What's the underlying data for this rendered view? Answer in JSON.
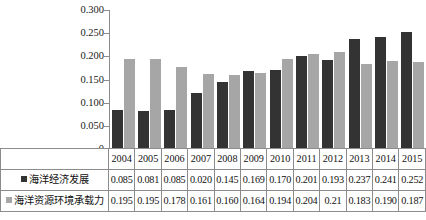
{
  "chart_data": {
    "type": "bar",
    "title": "",
    "xlabel": "",
    "ylabel": "",
    "ylim": [
      0,
      0.3
    ],
    "grid": false,
    "legend_position": "table-row-header",
    "categories": [
      "2004",
      "2005",
      "2006",
      "2007",
      "2008",
      "2009",
      "2010",
      "2011",
      "2012",
      "2013",
      "2014",
      "2015"
    ],
    "y_ticks": [
      "0.300",
      "0.250",
      "0.200",
      "0.150",
      "0.100",
      "0.050",
      "0"
    ],
    "y_tick_values": [
      0.3,
      0.25,
      0.2,
      0.15,
      0.1,
      0.05,
      0
    ],
    "series": [
      {
        "name": "海洋经济发展",
        "color": "#333333",
        "values": [
          0.085,
          0.081,
          0.085,
          0.02,
          0.145,
          0.169,
          0.17,
          0.201,
          0.193,
          0.237,
          0.241,
          0.252
        ],
        "labels": [
          "0.085",
          "0.081",
          "0.085",
          "0.020",
          "0.145",
          "0.169",
          "0.170",
          "0.201",
          "0.193",
          "0.237",
          "0.241",
          "0.252"
        ],
        "plotted_values": [
          0.085,
          0.081,
          0.085,
          0.12,
          0.145,
          0.169,
          0.17,
          0.201,
          0.193,
          0.237,
          0.241,
          0.252
        ]
      },
      {
        "name": "海洋资源环境承载力",
        "color": "#a6a6a6",
        "values": [
          0.195,
          0.195,
          0.178,
          0.161,
          0.16,
          0.164,
          0.194,
          0.204,
          0.21,
          0.183,
          0.19,
          0.187
        ],
        "labels": [
          "0.195",
          "0.195",
          "0.178",
          "0.161",
          "0.160",
          "0.164",
          "0.194",
          "0.204",
          "0.21",
          "0.183",
          "0.190",
          "0.187"
        ],
        "plotted_values": [
          0.195,
          0.195,
          0.178,
          0.161,
          0.16,
          0.164,
          0.194,
          0.204,
          0.21,
          0.183,
          0.19,
          0.187
        ]
      }
    ]
  },
  "colors": {
    "series_dark": "#333333",
    "series_light": "#a6a6a6",
    "axis": "#8c8c8c",
    "text": "#111111",
    "background": "#ffffff"
  }
}
